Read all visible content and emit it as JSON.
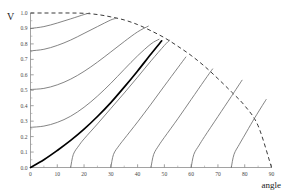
{
  "chart_data": {
    "type": "line",
    "title": "",
    "subtitle": "",
    "xlabel": "angle",
    "ylabel": "V",
    "xlim": [
      0,
      90
    ],
    "ylim": [
      0.0,
      1.0
    ],
    "grid": false,
    "legend_position": "none",
    "x_ticks": [
      0,
      10,
      20,
      30,
      40,
      50,
      60,
      70,
      80,
      90
    ],
    "x_tick_labels": [
      "0",
      "10",
      "20",
      "30",
      "40",
      "50",
      "60",
      "70",
      "80",
      "90"
    ],
    "x_minor_tick_step": 5,
    "y_ticks": [
      0.0,
      0.1,
      0.2,
      0.3,
      0.4,
      0.5,
      0.6,
      0.7,
      0.8,
      0.9,
      1.0
    ],
    "y_tick_labels": [
      "0.0",
      "0.1",
      "0.2",
      "0.3",
      "0.4",
      "0.5",
      "0.6",
      "0.7",
      "0.8",
      "0.9",
      "1.0"
    ],
    "colors": {
      "curve": "#6e6e6e",
      "highlight_curve": "#000000",
      "envelope": "#3a3a3a",
      "axis": "#8a8a8a",
      "tick_label": "#4a4a4a",
      "axis_title": "#222222",
      "background": "#ffffff"
    },
    "series": [
      {
        "name": "envelope",
        "style": "dashed",
        "color": "#3a3a3a",
        "x": [
          0,
          5,
          10,
          15,
          20,
          25,
          30,
          35,
          40,
          45,
          50,
          55,
          60,
          65,
          70,
          75,
          80,
          85,
          90
        ],
        "values": [
          1.0,
          1.0,
          1.0,
          1.0,
          0.998,
          0.99,
          0.975,
          0.955,
          0.925,
          0.885,
          0.84,
          0.785,
          0.725,
          0.655,
          0.575,
          0.49,
          0.4,
          0.27,
          0.0
        ]
      },
      {
        "name": "curve-1",
        "style": "solid",
        "color": "#6e6e6e",
        "x": [
          0,
          5,
          10,
          15,
          20,
          22
        ],
        "values": [
          0.9,
          0.912,
          0.935,
          0.962,
          0.99,
          1.0
        ]
      },
      {
        "name": "curve-2",
        "style": "solid",
        "color": "#6e6e6e",
        "x": [
          0,
          5,
          10,
          15,
          20,
          25,
          30,
          32
        ],
        "values": [
          0.755,
          0.765,
          0.79,
          0.825,
          0.868,
          0.912,
          0.955,
          0.965
        ]
      },
      {
        "name": "curve-3",
        "style": "solid",
        "color": "#6e6e6e",
        "x": [
          0,
          5,
          10,
          15,
          20,
          25,
          30,
          35,
          40,
          44
        ],
        "values": [
          0.505,
          0.512,
          0.535,
          0.572,
          0.622,
          0.682,
          0.748,
          0.815,
          0.878,
          0.915
        ]
      },
      {
        "name": "curve-4",
        "style": "solid",
        "color": "#6e6e6e",
        "x": [
          0,
          5,
          10,
          15,
          20,
          25,
          30,
          35,
          40,
          45,
          48
        ],
        "values": [
          0.26,
          0.268,
          0.292,
          0.332,
          0.39,
          0.462,
          0.545,
          0.635,
          0.723,
          0.8,
          0.83
        ]
      },
      {
        "name": "curve-5-highlight",
        "style": "solid-bold",
        "color": "#000000",
        "x": [
          0,
          5,
          10,
          15,
          20,
          25,
          30,
          35,
          40,
          45,
          49
        ],
        "values": [
          0.0,
          0.05,
          0.11,
          0.175,
          0.248,
          0.33,
          0.42,
          0.52,
          0.625,
          0.735,
          0.82
        ]
      },
      {
        "name": "curve-6",
        "style": "solid",
        "color": "#6e6e6e",
        "x": [
          15,
          16,
          18,
          20,
          25,
          30,
          35,
          40,
          45,
          50,
          52
        ],
        "values": [
          0.0,
          0.085,
          0.14,
          0.185,
          0.282,
          0.382,
          0.482,
          0.585,
          0.69,
          0.79,
          0.825
        ]
      },
      {
        "name": "curve-7",
        "style": "solid",
        "color": "#6e6e6e",
        "x": [
          30,
          31,
          33,
          35,
          40,
          45,
          50,
          55,
          58
        ],
        "values": [
          0.0,
          0.085,
          0.14,
          0.185,
          0.295,
          0.41,
          0.528,
          0.645,
          0.715
        ]
      },
      {
        "name": "curve-8",
        "style": "solid",
        "color": "#6e6e6e",
        "x": [
          45,
          46,
          48,
          50,
          55,
          60,
          65,
          68
        ],
        "values": [
          0.0,
          0.085,
          0.145,
          0.195,
          0.315,
          0.44,
          0.565,
          0.638
        ]
      },
      {
        "name": "curve-9",
        "style": "solid",
        "color": "#6e6e6e",
        "x": [
          60,
          61,
          63,
          65,
          70,
          75,
          79
        ],
        "values": [
          0.0,
          0.085,
          0.145,
          0.2,
          0.33,
          0.46,
          0.565
        ]
      },
      {
        "name": "curve-10",
        "style": "solid",
        "color": "#6e6e6e",
        "x": [
          75,
          76,
          78,
          80,
          83,
          86,
          88
        ],
        "values": [
          0.0,
          0.085,
          0.15,
          0.21,
          0.3,
          0.385,
          0.44
        ]
      }
    ]
  }
}
